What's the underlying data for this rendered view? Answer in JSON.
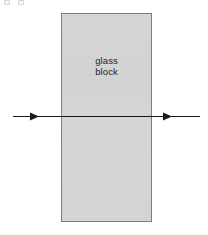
{
  "figure": {
    "background_color": "#ffffff",
    "width": 208,
    "height": 235
  },
  "glass_block": {
    "label_line1": "glass",
    "label_line2": "block",
    "fill_color": "#d2d2d2",
    "border_color": "#7d7d7d",
    "left": 61,
    "top": 13,
    "width": 91,
    "height": 209
  },
  "light_ray": {
    "name": "incident and emergent light ray",
    "color": "#1a1a1a",
    "y": 116,
    "start_x": 13,
    "end_x": 200,
    "incident_arrowhead_x": 38,
    "emergent_arrowhead_x": 172,
    "direction": "left to right",
    "deviation": "none"
  },
  "artifacts": {
    "top_edge_marks": 2
  }
}
